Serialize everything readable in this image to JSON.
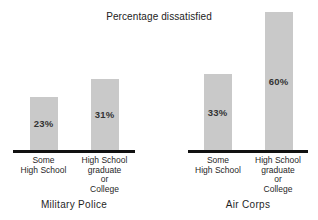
{
  "figure": {
    "background": "#ffffff"
  },
  "chart_data": {
    "type": "bar",
    "title": "Percentage dissatisfied",
    "xlabel": "",
    "ylabel": "",
    "value_suffix": "%",
    "ylim": [
      0,
      60
    ],
    "grid": false,
    "legend": false,
    "bar_color": "#c9c9c9",
    "axis_color": "#111111",
    "text_color": "#2a2a2a",
    "groups": [
      {
        "label": "Military Police",
        "categories": [
          "Some\nHigh School",
          "High School\ngraduate\nor\nCollege"
        ],
        "values": [
          23,
          31
        ],
        "value_labels": [
          "23%",
          "31%"
        ]
      },
      {
        "label": "Air Corps",
        "categories": [
          "Some\nHigh School",
          "High School\ngraduate\nor\nCollege"
        ],
        "values": [
          33,
          60
        ],
        "value_labels": [
          "33%",
          "60%"
        ]
      }
    ]
  }
}
